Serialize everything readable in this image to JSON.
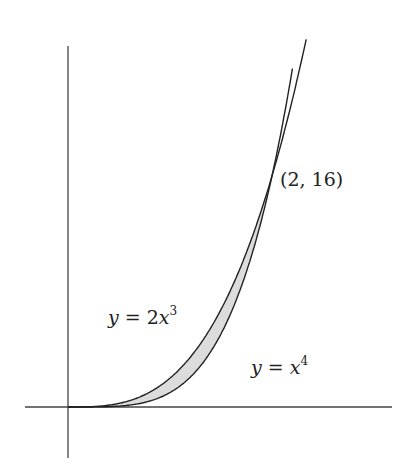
{
  "diagram": {
    "title": "",
    "axes": {
      "origin_px": [
        68,
        407
      ],
      "x_axis": {
        "from_px": 25,
        "to_px": 392
      },
      "y_axis": {
        "from_px": 46,
        "to_px": 458
      },
      "color": "#444444"
    },
    "scale": {
      "x_px_per_unit": 102,
      "y_px_per_unit": 14.44
    },
    "curves": [
      {
        "name": "y = 2x^3",
        "expr": "2x^3",
        "x_max": 2.335,
        "color": "#222222"
      },
      {
        "name": "y = x^4",
        "expr": "x^4",
        "x_max": 2.2,
        "color": "#222222"
      }
    ],
    "shaded_region": {
      "between": [
        "2x^3",
        "x^4"
      ],
      "x_range": [
        0,
        2
      ],
      "fill": "#dcdcdc"
    },
    "intersection_point": {
      "x": 2,
      "y": 16
    }
  },
  "labels": {
    "point": "(2, 16)",
    "curve1": {
      "lhs": "y",
      "eq": " = 2",
      "var": "x",
      "exp": "3"
    },
    "curve2": {
      "lhs": "y",
      "eq": " = ",
      "var": "x",
      "exp": "4"
    }
  }
}
